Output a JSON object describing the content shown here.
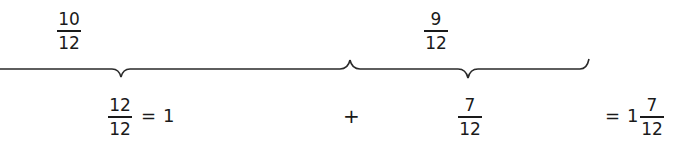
{
  "top_labels": [
    {
      "numerator": "10",
      "denominator": "12"
    },
    {
      "numerator": "9",
      "denominator": "12"
    }
  ],
  "equation": {
    "term1": {
      "numerator": "12",
      "denominator": "12"
    },
    "eq1": "=",
    "term1_value": "1",
    "plus": "+",
    "term2": {
      "numerator": "7",
      "denominator": "12"
    },
    "eq2": "=",
    "result_whole": "1",
    "result": {
      "numerator": "7",
      "denominator": "12"
    }
  }
}
